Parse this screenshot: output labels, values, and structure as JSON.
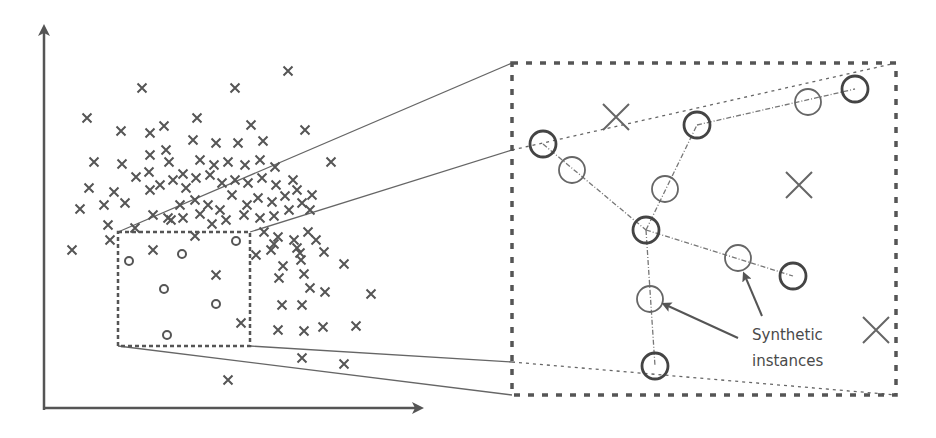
{
  "diagram": {
    "colors": {
      "stroke": "#555555",
      "light_stroke": "#777777",
      "background": "#ffffff"
    },
    "annotation": {
      "line1": "Synthetic",
      "line2": "instances"
    },
    "left_panel": {
      "majority_marker": "x",
      "minority_marker": "o",
      "selection_box": {
        "x1": 118,
        "y1": 232,
        "x2": 250,
        "y2": 346
      },
      "majority_points": [
        [
          142,
          88
        ],
        [
          235,
          88
        ],
        [
          288,
          71
        ],
        [
          87,
          118
        ],
        [
          121,
          131
        ],
        [
          150,
          133
        ],
        [
          164,
          126
        ],
        [
          197,
          118
        ],
        [
          251,
          125
        ],
        [
          305,
          130
        ],
        [
          94,
          162
        ],
        [
          122,
          164
        ],
        [
          150,
          155
        ],
        [
          166,
          150
        ],
        [
          193,
          140
        ],
        [
          216,
          143
        ],
        [
          238,
          143
        ],
        [
          263,
          141
        ],
        [
          331,
          162
        ],
        [
          89,
          188
        ],
        [
          114,
          192
        ],
        [
          136,
          177
        ],
        [
          149,
          172
        ],
        [
          169,
          162
        ],
        [
          183,
          174
        ],
        [
          200,
          160
        ],
        [
          214,
          165
        ],
        [
          228,
          162
        ],
        [
          245,
          165
        ],
        [
          260,
          160
        ],
        [
          275,
          167
        ],
        [
          80,
          209
        ],
        [
          104,
          205
        ],
        [
          125,
          203
        ],
        [
          150,
          190
        ],
        [
          160,
          185
        ],
        [
          173,
          180
        ],
        [
          186,
          188
        ],
        [
          196,
          178
        ],
        [
          210,
          175
        ],
        [
          222,
          183
        ],
        [
          235,
          180
        ],
        [
          248,
          183
        ],
        [
          262,
          178
        ],
        [
          276,
          185
        ],
        [
          293,
          180
        ],
        [
          108,
          225
        ],
        [
          135,
          228
        ],
        [
          153,
          215
        ],
        [
          168,
          218
        ],
        [
          180,
          205
        ],
        [
          195,
          200
        ],
        [
          208,
          205
        ],
        [
          220,
          210
        ],
        [
          232,
          195
        ],
        [
          247,
          205
        ],
        [
          258,
          198
        ],
        [
          272,
          202
        ],
        [
          285,
          196
        ],
        [
          297,
          190
        ],
        [
          312,
          195
        ],
        [
          72,
          250
        ],
        [
          110,
          240
        ],
        [
          171,
          220
        ],
        [
          183,
          218
        ],
        [
          200,
          214
        ],
        [
          212,
          224
        ],
        [
          226,
          220
        ],
        [
          244,
          215
        ],
        [
          260,
          218
        ],
        [
          274,
          216
        ],
        [
          289,
          210
        ],
        [
          302,
          203
        ],
        [
          310,
          210
        ],
        [
          264,
          232
        ],
        [
          278,
          237
        ],
        [
          294,
          240
        ],
        [
          308,
          232
        ],
        [
          274,
          244
        ],
        [
          297,
          248
        ],
        [
          316,
          240
        ],
        [
          324,
          252
        ],
        [
          344,
          264
        ],
        [
          153,
          250
        ],
        [
          195,
          236
        ],
        [
          216,
          275
        ],
        [
          256,
          255
        ],
        [
          271,
          250
        ],
        [
          300,
          253
        ],
        [
          283,
          266
        ],
        [
          301,
          260
        ],
        [
          279,
          278
        ],
        [
          304,
          274
        ],
        [
          310,
          288
        ],
        [
          325,
          292
        ],
        [
          371,
          294
        ],
        [
          282,
          305
        ],
        [
          302,
          305
        ],
        [
          241,
          323
        ],
        [
          278,
          330
        ],
        [
          304,
          331
        ],
        [
          323,
          327
        ],
        [
          356,
          326
        ],
        [
          302,
          358
        ],
        [
          344,
          364
        ],
        [
          228,
          380
        ]
      ],
      "minority_points": [
        [
          129,
          261
        ],
        [
          182,
          254
        ],
        [
          236,
          241
        ],
        [
          164,
          289
        ],
        [
          216,
          304
        ],
        [
          167,
          335
        ]
      ]
    },
    "right_panel": {
      "box": {
        "x1": 512,
        "y1": 63,
        "x2": 896,
        "y2": 395
      },
      "majority_points": [
        [
          616,
          117
        ],
        [
          799,
          185
        ],
        [
          876,
          330
        ]
      ],
      "original_minority": [
        [
          543,
          144
        ],
        [
          697,
          125
        ],
        [
          855,
          89
        ],
        [
          646,
          230
        ],
        [
          793,
          276
        ],
        [
          655,
          366
        ]
      ],
      "synthetic_minority": [
        [
          572,
          170
        ],
        [
          665,
          189
        ],
        [
          808,
          102
        ],
        [
          738,
          258
        ],
        [
          650,
          299
        ]
      ],
      "connections": [
        [
          [
            543,
            144
          ],
          [
            646,
            230
          ]
        ],
        [
          [
            646,
            230
          ],
          [
            697,
            125
          ]
        ],
        [
          [
            697,
            125
          ],
          [
            855,
            89
          ]
        ],
        [
          [
            646,
            230
          ],
          [
            793,
            276
          ]
        ],
        [
          [
            646,
            230
          ],
          [
            655,
            366
          ]
        ]
      ]
    },
    "axes": {
      "origin": [
        44,
        410
      ],
      "y_top": [
        44,
        28
      ],
      "x_right": [
        418,
        410
      ]
    }
  }
}
